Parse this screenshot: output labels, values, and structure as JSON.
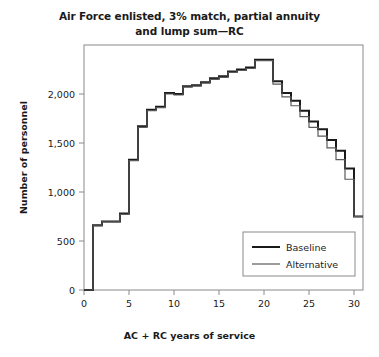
{
  "chart_data": {
    "type": "line",
    "title": "Air Force enlisted, 3% match, partial annuity and lump sum—RC",
    "title_line1": "Air Force enlisted, 3% match, partial annuity",
    "title_line2": "and lump sum—RC",
    "xlabel": "AC + RC years of service",
    "ylabel": "Number of personnel",
    "xlim": [
      0,
      31
    ],
    "ylim": [
      0,
      2500
    ],
    "xticks": [
      0,
      5,
      10,
      15,
      20,
      25,
      30
    ],
    "xtick_labels": [
      "0",
      "5",
      "10",
      "15",
      "20",
      "25",
      "30"
    ],
    "yticks": [
      0,
      500,
      1000,
      1500,
      2000
    ],
    "ytick_labels": [
      "0",
      "500",
      "1,000",
      "1,500",
      "2,000"
    ],
    "grid": false,
    "drawstyle": "steps-post",
    "legend_position": "lower right",
    "x": [
      0,
      1,
      2,
      3,
      4,
      5,
      6,
      7,
      8,
      9,
      10,
      11,
      12,
      13,
      14,
      15,
      16,
      17,
      18,
      19,
      20,
      21,
      22,
      23,
      24,
      25,
      26,
      27,
      28,
      29,
      30
    ],
    "series": [
      {
        "name": "Baseline",
        "color": "#1a1a1a",
        "width": 2.0,
        "values": [
          0,
          660,
          700,
          700,
          780,
          1330,
          1670,
          1840,
          1870,
          2010,
          2000,
          2080,
          2090,
          2120,
          2160,
          2180,
          2230,
          2250,
          2270,
          2350,
          2350,
          2130,
          2010,
          1930,
          1830,
          1720,
          1640,
          1530,
          1420,
          1240,
          750
        ]
      },
      {
        "name": "Alternative",
        "color": "#5a5a5a",
        "width": 1.2,
        "values": [
          0,
          655,
          695,
          695,
          772,
          1320,
          1660,
          1830,
          1860,
          2000,
          1990,
          2070,
          2080,
          2110,
          2150,
          2170,
          2220,
          2240,
          2260,
          2340,
          2340,
          2100,
          1970,
          1880,
          1770,
          1660,
          1570,
          1450,
          1330,
          1130,
          750
        ]
      }
    ],
    "legend": [
      {
        "label": "Baseline"
      },
      {
        "label": "Alternative"
      }
    ]
  },
  "axes": {
    "frame_color": "#8a8a8a"
  }
}
